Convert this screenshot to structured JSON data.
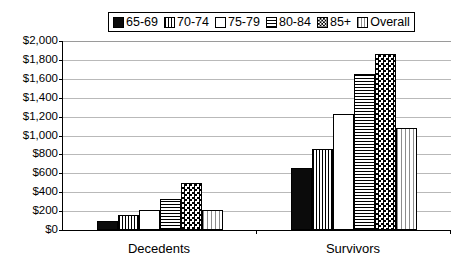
{
  "chart_data": {
    "type": "bar",
    "title": "",
    "xlabel": "",
    "ylabel": "",
    "categories": [
      "Decedents",
      "Survivors"
    ],
    "ylim": [
      0,
      2000
    ],
    "ytick_step": 200,
    "ytick_labels": [
      "$2,000",
      "$1,800",
      "$1,600",
      "$1,400",
      "$1,200",
      "$1,000",
      "$800",
      "$600",
      "$400",
      "$200",
      "$0"
    ],
    "ytick_values": [
      2000,
      1800,
      1600,
      1400,
      1200,
      1000,
      800,
      600,
      400,
      200,
      0
    ],
    "grid": true,
    "legend_position": "top-center",
    "series": [
      {
        "name": "65-69",
        "pattern": "solid-black",
        "values": [
          100,
          660
        ]
      },
      {
        "name": "70-74",
        "pattern": "vertical-lines",
        "values": [
          160,
          860
        ]
      },
      {
        "name": "75-79",
        "pattern": "white-empty",
        "values": [
          210,
          1230
        ]
      },
      {
        "name": "80-84",
        "pattern": "horizontal-lines",
        "values": [
          330,
          1650
        ]
      },
      {
        "name": "85+",
        "pattern": "checkerboard",
        "values": [
          500,
          1860
        ]
      },
      {
        "name": "Overall",
        "pattern": "light-vertical-dots",
        "values": [
          215,
          1080
        ]
      }
    ]
  },
  "legend": {
    "entries": [
      {
        "label": "65-69"
      },
      {
        "label": "70-74"
      },
      {
        "label": "75-79"
      },
      {
        "label": "80-84"
      },
      {
        "label": "85+"
      },
      {
        "label": "Overall"
      }
    ]
  }
}
